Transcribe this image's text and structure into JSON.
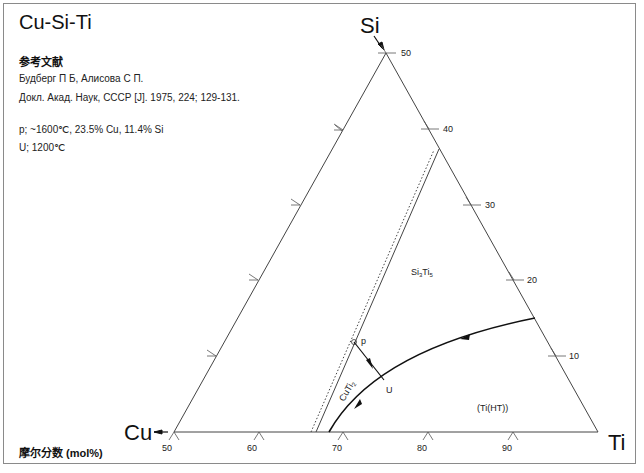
{
  "title": "Cu-Si-Ti",
  "references": {
    "heading": "参考文献",
    "lines": [
      "Будберг П Б, Алисова С П.",
      "Докл. Акад. Наук, СССР [J]. 1975, 224; 129-131."
    ]
  },
  "notes": [
    "p; ~1600℃, 23.5% Cu, 11.4% Si",
    "U; 1200℃"
  ],
  "footer": "摩尔分数 (mol%)",
  "diagram": {
    "corners": {
      "top": "Si",
      "left": "Cu",
      "right": "Ti"
    },
    "bottom_ticks": [
      "50",
      "60",
      "70",
      "80",
      "90"
    ],
    "right_ticks": [
      "50",
      "40",
      "30",
      "20",
      "10"
    ],
    "phase_labels": {
      "si3ti5": "Si3Ti5",
      "cuti2": "CuTi2",
      "ti_ht": "(Ti(HT))"
    },
    "points": {
      "p": "p",
      "u": "U"
    },
    "colors": {
      "lines": "#333333",
      "frame": "#8a8a8a"
    }
  }
}
